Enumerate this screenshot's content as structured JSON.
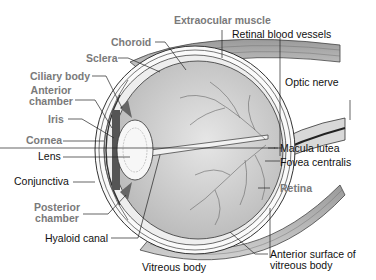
{
  "diagram": {
    "colors": {
      "gray_label": "#7a7a7a",
      "black_label": "#111111",
      "vitreous_fill": "#c8c8c8",
      "muscle_fill": "#b5b5b5"
    },
    "labels": {
      "extraocular_muscle": "Extraocular muscle",
      "retinal_blood_vessels": "Retinal blood vessels",
      "choroid": "Choroid",
      "sclera": "Sclera",
      "optic_nerve": "Optic nerve",
      "ciliary_body": "Ciliary body",
      "anterior_chamber_1": "Anterior",
      "anterior_chamber_2": "chamber",
      "iris": "Iris",
      "cornea": "Cornea",
      "lens": "Lens",
      "conjunctiva": "Conjunctiva",
      "macula_lutea": "Macula lutea",
      "fovea_centralis": "Fovea centralis",
      "retina": "Retina",
      "posterior_chamber_1": "Posterior",
      "posterior_chamber_2": "chamber",
      "hyaloid_canal": "Hyaloid canal",
      "vitreous_body": "Vitreous body",
      "anterior_surface_1": "Anterior surface of",
      "anterior_surface_2": "vitreous body"
    }
  }
}
